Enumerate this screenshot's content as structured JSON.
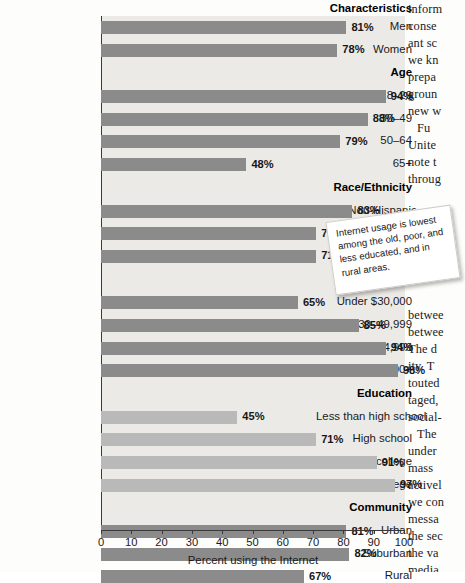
{
  "chart_data": {
    "type": "bar",
    "title": "",
    "xlabel": "Percent using the Internet",
    "ylabel": "",
    "xlim": [
      0,
      100
    ],
    "orientation": "horizontal",
    "grid": false,
    "legend": null,
    "group_header": "Characteristics",
    "tick_labels": [
      "0",
      "10",
      "20",
      "30",
      "40",
      "50",
      "60",
      "70",
      "80",
      "90",
      "100"
    ],
    "ticks": [
      0,
      10,
      20,
      30,
      40,
      50,
      60,
      70,
      80,
      90,
      100
    ],
    "groups": [
      {
        "name": "",
        "items": [
          {
            "label": "Men",
            "value": 81,
            "value_label": "81%",
            "shade": "dark"
          },
          {
            "label": "Women",
            "value": 78,
            "value_label": "78%",
            "shade": "dark"
          }
        ]
      },
      {
        "name": "Age",
        "items": [
          {
            "label": "18–29",
            "value": 94,
            "value_label": "94%",
            "shade": "dark"
          },
          {
            "label": "30–49",
            "value": 88,
            "value_label": "88%",
            "shade": "dark"
          },
          {
            "label": "50–64",
            "value": 79,
            "value_label": "79%",
            "shade": "dark"
          },
          {
            "label": "65+",
            "value": 48,
            "value_label": "48%",
            "shade": "dark"
          }
        ]
      },
      {
        "name": "Race/Ethnicity",
        "items": [
          {
            "label": "White Non-Hispanic",
            "value": 83,
            "value_label": "83%",
            "shade": "dark"
          },
          {
            "label": "Black",
            "value": 71,
            "value_label": "71%",
            "shade": "dark"
          },
          {
            "label": "Hispanic",
            "value": 71,
            "value_label": "71%",
            "shade": "dark"
          }
        ]
      },
      {
        "name": "Income",
        "items": [
          {
            "label": "Under $30,000",
            "value": 65,
            "value_label": "65%",
            "shade": "dark"
          },
          {
            "label": "$30–49,999",
            "value": 85,
            "value_label": "85%",
            "shade": "dark"
          },
          {
            "label": "$50–74,999",
            "value": 94,
            "value_label": "94%",
            "shade": "dark"
          },
          {
            "label": "$75,000+",
            "value": 98,
            "value_label": "98%",
            "shade": "dark"
          }
        ]
      },
      {
        "name": "Education",
        "items": [
          {
            "label": "Less than high school",
            "value": 45,
            "value_label": "45%",
            "shade": "light"
          },
          {
            "label": "High school",
            "value": 71,
            "value_label": "71%",
            "shade": "light"
          },
          {
            "label": "Some college",
            "value": 91,
            "value_label": "91%",
            "shade": "light"
          },
          {
            "label": "College",
            "value": 97,
            "value_label": "97%",
            "shade": "light"
          }
        ]
      },
      {
        "name": "Community",
        "items": [
          {
            "label": "Urban",
            "value": 81,
            "value_label": "81%",
            "shade": "dark"
          },
          {
            "label": "Suburban",
            "value": 82,
            "value_label": "82%",
            "shade": "dark"
          },
          {
            "label": "Rural",
            "value": 67,
            "value_label": "67%",
            "shade": "dark"
          }
        ]
      }
    ]
  },
  "callout": {
    "text": "Internet usage is lowest among the old, poor, and less educated, and in rural areas."
  },
  "book_text": {
    "lines": [
      "inform",
      "conse",
      "ant sc",
      "we kn",
      "prepa",
      "groun",
      "new w",
      "Fu",
      "Unite",
      "note t",
      "throug",
      "",
      "",
      "",
      "",
      "",
      "",
      "",
      "betwee",
      "betwee",
      "The d",
      "ity. T",
      "touted",
      "taged,",
      "social-",
      "The",
      "under",
      "mass",
      "activel",
      "we con",
      "messa",
      "the sec",
      "the va",
      "media"
    ]
  },
  "colors": {
    "bar_dark": "#8b8b8b",
    "bar_light": "#b9b9b9",
    "plot_background": "#eceae6",
    "axis": "#3a3a3a",
    "text": "#1a1a1a"
  }
}
